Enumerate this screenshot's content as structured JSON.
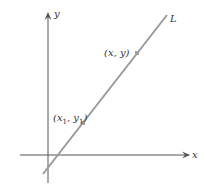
{
  "diagram": {
    "title": "",
    "axes": {
      "x_label": "x",
      "y_label": "y",
      "color": "#555555"
    },
    "line": {
      "label": "L",
      "color": "#9a9a9a"
    },
    "points": [
      {
        "label_main": "(x",
        "label_sub": "1",
        "label_mid": ", y",
        "label_sub2": "1",
        "label_end": ")",
        "color": "#a0a0a0"
      },
      {
        "label": "(x,  y)",
        "color": "#a0a0a0"
      }
    ]
  }
}
